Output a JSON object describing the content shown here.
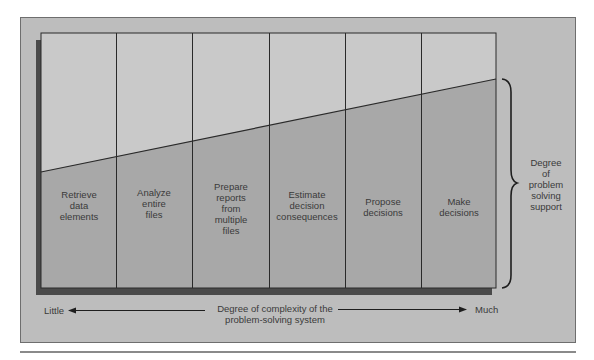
{
  "diagram": {
    "columns": [
      {
        "label_lines": [
          "Retrieve",
          "data",
          "elements"
        ]
      },
      {
        "label_lines": [
          "Analyze",
          "entire",
          "files"
        ]
      },
      {
        "label_lines": [
          "Prepare",
          "reports",
          "from",
          "multiple",
          "files"
        ]
      },
      {
        "label_lines": [
          "Estimate",
          "decision",
          "consequences"
        ]
      },
      {
        "label_lines": [
          "Propose",
          "decisions"
        ]
      },
      {
        "label_lines": [
          "Make",
          "decisions"
        ]
      }
    ],
    "columns_text": [
      "Retrieve\ndata\nelements",
      "Analyze\nentire\nfiles",
      "Prepare\nreports\nfrom\nmultiple\nfiles",
      "Estimate\ndecision\nconsequences",
      "Propose\ndecisions",
      "Make\ndecisions"
    ],
    "side_label": "Degree\nof\nproblem\nsolving\nsupport",
    "x_axis": {
      "left_label": "Little",
      "right_label": "Much",
      "center_label": "Degree of complexity of the\nproblem-solving system",
      "left_arrow_icon": "arrow-left-icon",
      "right_arrow_icon": "arrow-right-icon"
    },
    "brace_icon": "curly-brace-icon",
    "colors": {
      "frame_bg": "#bdbdbd",
      "upper_region": "#c9c9c9",
      "lower_region": "#a8a8a8",
      "shadow": "#4a4a4a",
      "lines": "#2a2a2a",
      "text": "#3a3a3a"
    }
  }
}
